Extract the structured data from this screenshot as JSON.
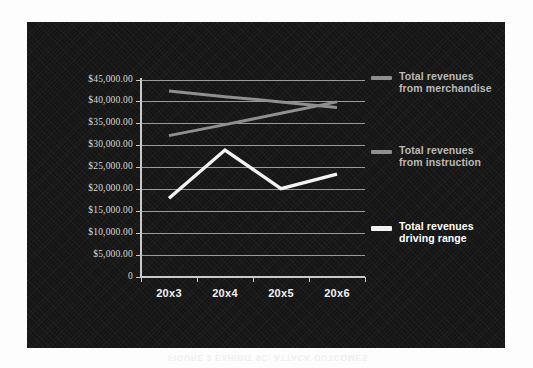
{
  "figure": {
    "bleed_caption": "FIGURE 2 EXHIBIT 9C: ATTACK OUTCOMES",
    "panel_background": "#151515"
  },
  "chart_data": {
    "type": "line",
    "title": "",
    "subtitle": "",
    "xlabel": "",
    "ylabel": "",
    "categories": [
      "20x3",
      "20x4",
      "20x5",
      "20x6"
    ],
    "ylim": [
      0,
      45000
    ],
    "yticks": [
      0,
      5000,
      10000,
      15000,
      20000,
      25000,
      30000,
      35000,
      40000,
      45000
    ],
    "ytick_labels": [
      "0",
      "$5,000.00",
      "$10,000.00",
      "$15,000.00",
      "$20,000.00",
      "$25,000.00",
      "$30,000.00",
      "$35,000.00",
      "$40,000.00",
      "$45,000.00"
    ],
    "grid": true,
    "grid_color": "#9a9a9a",
    "legend_position": "right",
    "series": [
      {
        "name": "Total revenues\nfrom merchandise",
        "color": "#8f8f8f",
        "values": [
          42500,
          41200,
          40000,
          38700
        ]
      },
      {
        "name": "Total revenues\nfrom instruction",
        "color": "#8f8f8f",
        "values": [
          32300,
          34800,
          37400,
          40000
        ]
      },
      {
        "name": "Total revenues\ndriving range",
        "color": "#f2f2f2",
        "values": [
          18000,
          29000,
          20200,
          23500
        ]
      }
    ]
  },
  "axis": {
    "axis_color": "#c9c9c9",
    "tick_color": "#c9c9c9",
    "ylabel_color": "#d8d8d8",
    "xlabel_color": "#f2f2f2"
  },
  "legend": {
    "items": [
      {
        "label": "Total revenues\nfrom merchandise",
        "swatch_color": "#8f8f8f",
        "text_color": "#b9b9b9"
      },
      {
        "label": "Total revenues\nfrom instruction",
        "swatch_color": "#8f8f8f",
        "text_color": "#b9b9b9"
      },
      {
        "label": "Total revenues\ndriving range",
        "swatch_color": "#f2f2f2",
        "text_color": "#ffffff"
      }
    ]
  }
}
